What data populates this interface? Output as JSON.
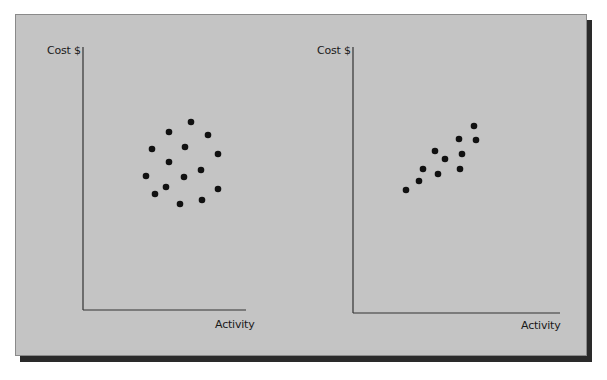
{
  "chart_data": [
    {
      "type": "scatter",
      "title": "",
      "xlabel": "Activity",
      "ylabel": "Cost $",
      "grid": false,
      "legend": null,
      "description": "No correlation between activity and cost",
      "points": [
        [
          191,
          122
        ],
        [
          169,
          132
        ],
        [
          208,
          135
        ],
        [
          152,
          149
        ],
        [
          185,
          147
        ],
        [
          218,
          154
        ],
        [
          169,
          162
        ],
        [
          201,
          170
        ],
        [
          146,
          176
        ],
        [
          184,
          177
        ],
        [
          166,
          187
        ],
        [
          155,
          194
        ],
        [
          218,
          189
        ],
        [
          180,
          204
        ],
        [
          202,
          200
        ]
      ]
    },
    {
      "type": "scatter",
      "title": "",
      "xlabel": "Activity",
      "ylabel": "Cost $",
      "grid": false,
      "legend": null,
      "description": "Positive correlation between activity and cost",
      "points": [
        [
          474,
          126
        ],
        [
          459,
          139
        ],
        [
          476,
          140
        ],
        [
          435,
          151
        ],
        [
          445,
          159
        ],
        [
          462,
          154
        ],
        [
          423,
          169
        ],
        [
          438,
          174
        ],
        [
          460,
          169
        ],
        [
          419,
          181
        ],
        [
          406,
          190
        ]
      ]
    }
  ],
  "left_chart": {
    "ylabel": "Cost $",
    "xlabel": "Activity"
  },
  "right_chart": {
    "ylabel": "Cost $",
    "xlabel": "Activity"
  },
  "colors": {
    "panel": "#c4c4c4",
    "shadow": "#2a2a2a",
    "dot": "#111111",
    "axis": "#333333"
  }
}
